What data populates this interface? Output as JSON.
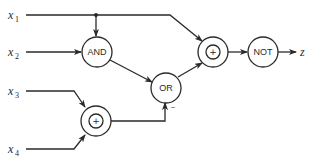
{
  "diagram": {
    "type": "logic-circuit",
    "inputs": [
      {
        "id": "x1",
        "name": "x",
        "sub": "1"
      },
      {
        "id": "x2",
        "name": "x",
        "sub": "2"
      },
      {
        "id": "x3",
        "name": "x",
        "sub": "3"
      },
      {
        "id": "x4",
        "name": "x",
        "sub": "4"
      }
    ],
    "gates": {
      "and": {
        "label": "AND"
      },
      "or": {
        "label": "OR",
        "negated_input_mark": "–"
      },
      "xor_top": {
        "label": "+"
      },
      "xor_bottom": {
        "label": "+"
      },
      "not": {
        "label": "NOT"
      }
    },
    "output": {
      "name": "z"
    },
    "connections": [
      "x1 -> AND",
      "x1 -> XOR(top)",
      "x2 -> AND",
      "AND -> OR",
      "x3 -> XOR(bottom)",
      "x4 -> XOR(bottom)",
      "XOR(bottom) -> OR (inverted input)",
      "OR -> XOR(top)",
      "XOR(top) -> NOT",
      "NOT -> z"
    ],
    "colors": {
      "ink": "#2a2a2a",
      "background": "#ffffff"
    }
  }
}
